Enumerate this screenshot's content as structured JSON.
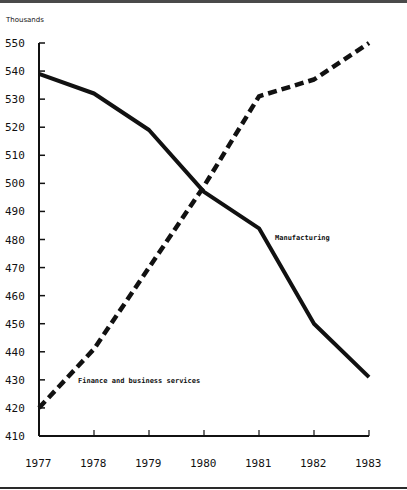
{
  "chart_data": {
    "type": "line",
    "title": "",
    "xlabel": "",
    "ylabel": "Thousands",
    "x": [
      "1977",
      "1978",
      "1979",
      "1980",
      "1981",
      "1982",
      "1983"
    ],
    "ylim": [
      410,
      550
    ],
    "yticks": [
      410,
      420,
      430,
      440,
      450,
      460,
      470,
      480,
      490,
      500,
      510,
      520,
      530,
      540,
      550
    ],
    "grid": false,
    "legend": "inline labels",
    "series": [
      {
        "name": "Manufacturing",
        "style": "solid",
        "values": [
          539,
          532,
          519,
          497,
          484,
          450,
          431
        ]
      },
      {
        "name": "Finance and business services",
        "style": "dashed",
        "values": [
          420,
          441,
          470,
          499,
          531,
          537,
          550
        ]
      }
    ]
  },
  "labels": {
    "y_unit": "Thousands",
    "manufacturing": "Manufacturing",
    "finance": "Finance and business services"
  }
}
